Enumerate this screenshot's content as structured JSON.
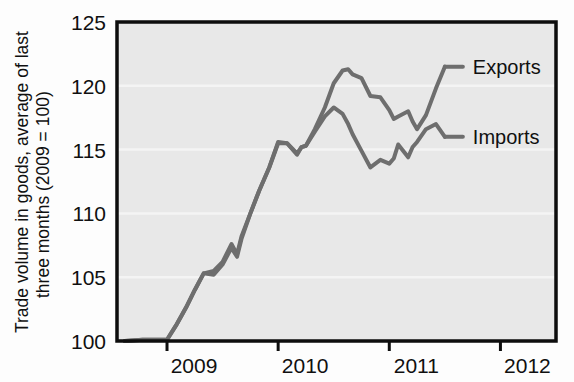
{
  "chart_data": {
    "type": "line",
    "title": "",
    "subtitle": "",
    "xlabel": "",
    "ylabel": "Trade volume in goods, average of last three months (2009 = 100)",
    "ylabel_line1": "Trade volume in goods, average of last",
    "ylabel_line2": "three months (2009 = 100)",
    "ylim": [
      100,
      125
    ],
    "yticks": [
      100,
      105,
      110,
      115,
      120,
      125
    ],
    "ytick_labels": [
      "100",
      "105",
      "110",
      "115",
      "120",
      "125"
    ],
    "xlim": [
      2008.55,
      2012.5
    ],
    "xticks": [
      2009,
      2010,
      2011,
      2012
    ],
    "xtick_labels": [
      "2009",
      "2010",
      "2011",
      "2012"
    ],
    "grid": true,
    "grid_axis": "y",
    "grid_color": "#f4f4f4",
    "plot_bgcolor": "#e8e8e8",
    "legend_position": "inline-right-end",
    "line_color": "#6e6e6e",
    "line_width": 4,
    "series": [
      {
        "name": "Exports",
        "label": "Exports",
        "color": "#6e6e6e",
        "x": [
          2008.62,
          2008.78,
          2008.92,
          2009.0,
          2009.08,
          2009.17,
          2009.25,
          2009.33,
          2009.42,
          2009.5,
          2009.58,
          2009.63,
          2009.67,
          2009.75,
          2009.83,
          2009.92,
          2010.0,
          2010.08,
          2010.17,
          2010.21,
          2010.25,
          2010.33,
          2010.42,
          2010.5,
          2010.58,
          2010.63,
          2010.67,
          2010.75,
          2010.83,
          2010.92,
          2011.0,
          2011.04,
          2011.08,
          2011.17,
          2011.21,
          2011.25,
          2011.33,
          2011.42,
          2011.5
        ],
        "y": [
          100.0,
          100.1,
          100.1,
          100.1,
          101.2,
          102.6,
          104.0,
          105.3,
          105.5,
          106.2,
          107.6,
          106.8,
          108.2,
          110.0,
          111.8,
          113.6,
          115.5,
          115.5,
          114.6,
          115.2,
          115.3,
          116.6,
          118.3,
          120.2,
          121.2,
          121.3,
          120.9,
          120.6,
          119.2,
          119.1,
          118.1,
          117.4,
          117.6,
          118.0,
          117.2,
          116.6,
          117.7,
          119.8,
          121.5
        ]
      },
      {
        "name": "Imports",
        "label": "Imports",
        "color": "#6e6e6e",
        "x": [
          2008.62,
          2008.78,
          2008.92,
          2009.0,
          2009.08,
          2009.17,
          2009.25,
          2009.33,
          2009.42,
          2009.5,
          2009.58,
          2009.63,
          2009.67,
          2009.75,
          2009.83,
          2009.92,
          2010.0,
          2010.08,
          2010.17,
          2010.21,
          2010.25,
          2010.33,
          2010.42,
          2010.5,
          2010.58,
          2010.63,
          2010.67,
          2010.75,
          2010.83,
          2010.92,
          2011.0,
          2011.04,
          2011.08,
          2011.17,
          2011.21,
          2011.25,
          2011.33,
          2011.42,
          2011.5
        ],
        "y": [
          100.0,
          100.1,
          100.1,
          100.1,
          101.2,
          102.6,
          104.0,
          105.3,
          105.2,
          106.0,
          107.3,
          106.6,
          108.0,
          110.0,
          111.8,
          113.6,
          115.6,
          115.5,
          114.7,
          115.2,
          115.3,
          116.4,
          117.6,
          118.3,
          117.8,
          117.0,
          116.2,
          114.9,
          113.6,
          114.2,
          113.9,
          114.3,
          115.4,
          114.4,
          115.2,
          115.6,
          116.6,
          117.0,
          116.0
        ]
      }
    ],
    "annotations": [
      {
        "text": "Exports",
        "series": "Exports",
        "value": 121.5
      },
      {
        "text": "Imports",
        "series": "Imports",
        "value": 116.0
      }
    ]
  }
}
